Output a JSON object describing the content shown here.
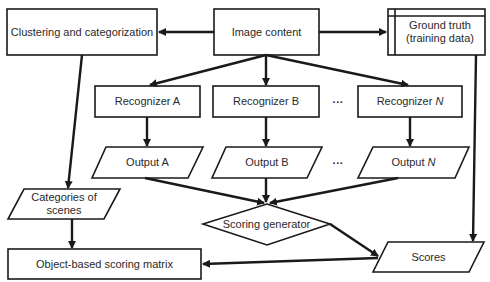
{
  "diagram": {
    "nodes": {
      "clustering": {
        "label": "Clustering and categorization",
        "shape": "rectangle"
      },
      "image_content": {
        "label": "Image content",
        "shape": "rectangle"
      },
      "ground_truth": {
        "label_line1": "Ground truth",
        "label_line2": "(training data)",
        "shape": "data-store"
      },
      "recognizer_a": {
        "label": "Recognizer A",
        "shape": "rectangle"
      },
      "recognizer_b": {
        "label": "Recognizer B",
        "shape": "rectangle"
      },
      "recognizer_n": {
        "label_prefix": "Recognizer ",
        "label_var": "N",
        "shape": "rectangle"
      },
      "output_a": {
        "label": "Output A",
        "shape": "parallelogram"
      },
      "output_b": {
        "label": "Output B",
        "shape": "parallelogram"
      },
      "output_n": {
        "label_prefix": "Output ",
        "label_var": "N",
        "shape": "parallelogram"
      },
      "categories": {
        "label_line1": "Categories of",
        "label_line2": "scenes",
        "shape": "parallelogram"
      },
      "scoring_generator": {
        "label": "Scoring generator",
        "shape": "diamond"
      },
      "object_matrix": {
        "label": "Object-based scoring matrix",
        "shape": "rectangle"
      },
      "scores": {
        "label": "Scores",
        "shape": "parallelogram"
      }
    },
    "ellipsis_recognizers": "···",
    "ellipsis_outputs": "···",
    "edges": [
      [
        "image_content",
        "clustering"
      ],
      [
        "image_content",
        "ground_truth"
      ],
      [
        "image_content",
        "recognizer_a"
      ],
      [
        "image_content",
        "recognizer_b"
      ],
      [
        "image_content",
        "recognizer_n"
      ],
      [
        "recognizer_a",
        "output_a"
      ],
      [
        "recognizer_b",
        "output_b"
      ],
      [
        "recognizer_n",
        "output_n"
      ],
      [
        "clustering",
        "categories"
      ],
      [
        "output_a",
        "scoring_generator"
      ],
      [
        "output_b",
        "scoring_generator"
      ],
      [
        "output_n",
        "scoring_generator"
      ],
      [
        "categories",
        "object_matrix"
      ],
      [
        "scoring_generator",
        "scores"
      ],
      [
        "ground_truth",
        "scores"
      ],
      [
        "scores",
        "object_matrix"
      ]
    ],
    "colors": {
      "stroke": "#1a1a1a",
      "text": "#2a2a2a",
      "background": "#ffffff"
    }
  }
}
